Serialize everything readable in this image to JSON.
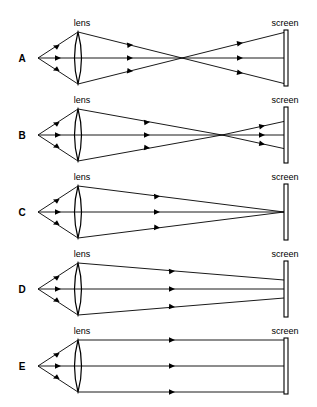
{
  "figure": {
    "background_color": "#ffffff",
    "line_color": "#000000",
    "width": 317,
    "height": 407
  },
  "labels": {
    "lens": "lens",
    "screen": "screen"
  },
  "rows": [
    {
      "id": "A",
      "label": "A",
      "lens_label": "lens",
      "screen_label": "screen",
      "description": "Rays converge to a focal point well before the screen, then diverge widely onto the screen",
      "focus_position": "before screen",
      "spread_at_screen": "large"
    },
    {
      "id": "B",
      "label": "B",
      "lens_label": "lens",
      "screen_label": "screen",
      "description": "Rays converge to a focal point a short distance before the screen, then diverge slightly onto the screen",
      "focus_position": "slightly before screen",
      "spread_at_screen": "small"
    },
    {
      "id": "C",
      "label": "C",
      "lens_label": "lens",
      "screen_label": "screen",
      "description": "Rays converge exactly at the screen forming a sharp focused point",
      "focus_position": "at screen",
      "spread_at_screen": "none"
    },
    {
      "id": "D",
      "label": "D",
      "lens_label": "lens",
      "screen_label": "screen",
      "description": "Rays are still converging when they reach the screen; focus lies beyond the screen",
      "focus_position": "beyond screen",
      "spread_at_screen": "small"
    },
    {
      "id": "E",
      "label": "E",
      "lens_label": "lens",
      "screen_label": "screen",
      "description": "Rays emerge parallel from the lens and strike the screen without converging",
      "focus_position": "at infinity",
      "spread_at_screen": "full lens aperture"
    }
  ],
  "geometry": {
    "source_x": 38,
    "lens_x": 78,
    "screen_x": 286,
    "lens_half_height": 26,
    "row_centers": [
      58,
      135,
      212,
      289,
      366
    ],
    "crossing_x": {
      "A": 182,
      "B": 222,
      "C": 284,
      "D": 340,
      "E": null
    }
  }
}
